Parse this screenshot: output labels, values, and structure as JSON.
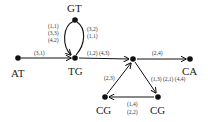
{
  "diagram": {
    "type": "directed-graph",
    "nodes": [
      {
        "id": "AT",
        "label": "AT"
      },
      {
        "id": "TG",
        "label": "TG"
      },
      {
        "id": "GT",
        "label": "GT"
      },
      {
        "id": "HUB",
        "label": ""
      },
      {
        "id": "CA",
        "label": "CA"
      },
      {
        "id": "CG1",
        "label": "CG"
      },
      {
        "id": "CG2",
        "label": "CG"
      }
    ],
    "edges": [
      {
        "from": "AT",
        "to": "TG",
        "labels": [
          "(3,1)"
        ]
      },
      {
        "from": "GT",
        "to": "TG",
        "labels": [
          "(1,1)",
          "(3,3)",
          "(4,2)"
        ]
      },
      {
        "from": "TG",
        "to": "GT",
        "labels": [
          "(3,2)",
          "(1,1)"
        ]
      },
      {
        "from": "TG",
        "to": "HUB",
        "labels": [
          "(1,2) (4,3)"
        ]
      },
      {
        "from": "HUB",
        "to": "CA",
        "labels": [
          "(2,4)"
        ]
      },
      {
        "from": "HUB",
        "to": "CG2",
        "labels": [
          "(1,3) (2,1) (4,4)"
        ]
      },
      {
        "from": "CG2",
        "to": "CG1",
        "labels": [
          "(1,4)",
          "(2,2)"
        ]
      },
      {
        "from": "CG1",
        "to": "HUB",
        "labels": [
          "(2,3)"
        ]
      }
    ]
  },
  "text": {
    "node_at": "AT",
    "node_tg": "TG",
    "node_gt": "GT",
    "node_ca": "CA",
    "node_cg_left": "CG",
    "node_cg_right": "CG",
    "edge_at_tg": "(3,1)",
    "edge_gt_tg_1": "(1,1)",
    "edge_gt_tg_2": "(3,3)",
    "edge_gt_tg_3": "(4,2)",
    "edge_tg_gt_1": "(3,2)",
    "edge_tg_gt_2": "(1,1)",
    "edge_tg_hub": "(1,2) (4,3)",
    "edge_hub_ca": "(2,4)",
    "edge_hub_cg": "(1,3) (2,1) (4,4)",
    "edge_cg_cg_1": "(1,4)",
    "edge_cg_cg_2": "(2,2)",
    "edge_cg_hub": "(2,3)"
  }
}
